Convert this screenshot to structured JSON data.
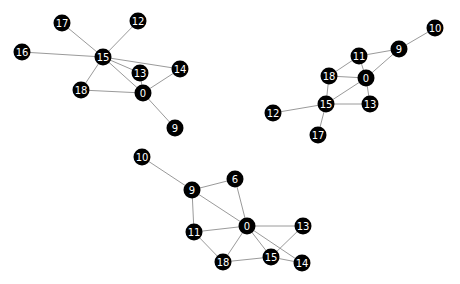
{
  "diagram": {
    "type": "network-graph",
    "width": 460,
    "height": 284,
    "colors": {
      "background": "#ffffff",
      "node_fill": "#000000",
      "node_label": "#ffffff",
      "edge": "#9a9a9a"
    },
    "node_radius": 8.5,
    "graphs": [
      {
        "id": "graph-top-left",
        "nodes": [
          {
            "id": "17",
            "x": 62,
            "y": 23
          },
          {
            "id": "12",
            "x": 138,
            "y": 21
          },
          {
            "id": "16",
            "x": 22,
            "y": 52
          },
          {
            "id": "15",
            "x": 103,
            "y": 57
          },
          {
            "id": "14",
            "x": 180,
            "y": 69
          },
          {
            "id": "13",
            "x": 140,
            "y": 73
          },
          {
            "id": "18",
            "x": 81,
            "y": 90
          },
          {
            "id": "0",
            "x": 143,
            "y": 93
          },
          {
            "id": "9",
            "x": 175,
            "y": 128
          }
        ],
        "edges": [
          [
            "17",
            "15"
          ],
          [
            "12",
            "15"
          ],
          [
            "16",
            "15"
          ],
          [
            "15",
            "13"
          ],
          [
            "15",
            "14"
          ],
          [
            "15",
            "0"
          ],
          [
            "15",
            "18"
          ],
          [
            "13",
            "0"
          ],
          [
            "14",
            "0"
          ],
          [
            "18",
            "0"
          ],
          [
            "0",
            "9"
          ]
        ]
      },
      {
        "id": "graph-top-right",
        "nodes": [
          {
            "id": "10",
            "x": 435,
            "y": 28
          },
          {
            "id": "9",
            "x": 399,
            "y": 49
          },
          {
            "id": "11",
            "x": 359,
            "y": 56
          },
          {
            "id": "18",
            "x": 329,
            "y": 76
          },
          {
            "id": "0",
            "x": 366,
            "y": 78
          },
          {
            "id": "15",
            "x": 326,
            "y": 104
          },
          {
            "id": "13",
            "x": 370,
            "y": 104
          },
          {
            "id": "12",
            "x": 273,
            "y": 113
          },
          {
            "id": "17",
            "x": 318,
            "y": 135
          }
        ],
        "edges": [
          [
            "10",
            "9"
          ],
          [
            "9",
            "11"
          ],
          [
            "9",
            "0"
          ],
          [
            "11",
            "18"
          ],
          [
            "11",
            "0"
          ],
          [
            "18",
            "0"
          ],
          [
            "18",
            "15"
          ],
          [
            "15",
            "0"
          ],
          [
            "0",
            "13"
          ],
          [
            "15",
            "13"
          ],
          [
            "15",
            "12"
          ],
          [
            "15",
            "17"
          ]
        ]
      },
      {
        "id": "graph-bottom",
        "nodes": [
          {
            "id": "10",
            "x": 142,
            "y": 157
          },
          {
            "id": "9",
            "x": 192,
            "y": 190
          },
          {
            "id": "6",
            "x": 235,
            "y": 179
          },
          {
            "id": "11",
            "x": 194,
            "y": 232
          },
          {
            "id": "0",
            "x": 247,
            "y": 226
          },
          {
            "id": "13",
            "x": 303,
            "y": 226
          },
          {
            "id": "18",
            "x": 223,
            "y": 262
          },
          {
            "id": "15",
            "x": 271,
            "y": 257
          },
          {
            "id": "14",
            "x": 302,
            "y": 263
          }
        ],
        "edges": [
          [
            "10",
            "9"
          ],
          [
            "9",
            "6"
          ],
          [
            "9",
            "0"
          ],
          [
            "9",
            "11"
          ],
          [
            "6",
            "0"
          ],
          [
            "11",
            "0"
          ],
          [
            "11",
            "18"
          ],
          [
            "0",
            "18"
          ],
          [
            "0",
            "13"
          ],
          [
            "0",
            "15"
          ],
          [
            "0",
            "14"
          ],
          [
            "18",
            "15"
          ],
          [
            "15",
            "13"
          ],
          [
            "15",
            "14"
          ]
        ]
      }
    ]
  }
}
